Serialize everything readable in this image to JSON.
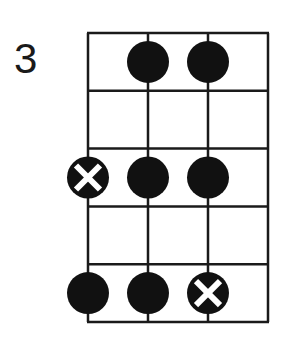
{
  "diagram": {
    "type": "fretboard",
    "start_fret_label": "3",
    "strings": 4,
    "frets": 5,
    "grid": {
      "left": 88,
      "right": 268,
      "top": 33,
      "bottom": 322
    },
    "colors": {
      "line": "#1a1a1a",
      "dot": "#111111",
      "x_mark": "#ffffff"
    },
    "notes": [
      {
        "string": 2,
        "fret": 1,
        "kind": "dot"
      },
      {
        "string": 3,
        "fret": 1,
        "kind": "dot"
      },
      {
        "string": 1,
        "fret": 3,
        "kind": "root-x"
      },
      {
        "string": 2,
        "fret": 3,
        "kind": "dot"
      },
      {
        "string": 3,
        "fret": 3,
        "kind": "dot"
      },
      {
        "string": 1,
        "fret": 5,
        "kind": "dot"
      },
      {
        "string": 2,
        "fret": 5,
        "kind": "dot"
      },
      {
        "string": 3,
        "fret": 5,
        "kind": "root-x"
      }
    ]
  }
}
